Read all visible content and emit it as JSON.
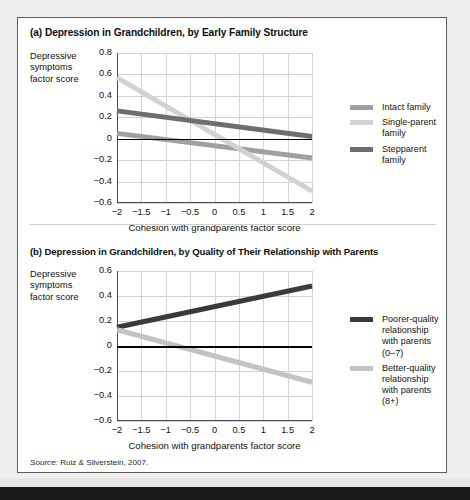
{
  "figure": {
    "source_prefix": "Source:",
    "source_text": "Ruiz & Silverstein, 2007."
  },
  "panel_a": {
    "title": "(a) Depression in Grandchildren, by Early Family Structure",
    "ycaption_line1": "Depressive",
    "ycaption_line2": "symptoms",
    "ycaption_line3": "factor score",
    "legend": [
      {
        "label": "Intact family",
        "color": "#a0a0a0"
      },
      {
        "label": "Single-parent family",
        "color": "#d2d2d2"
      },
      {
        "label": "Stepparent family",
        "color": "#6e6e6e"
      }
    ]
  },
  "panel_b": {
    "title": "(b) Depression in Grandchildren, by Quality of Their Relationship with Parents",
    "ycaption_line1": "Depressive",
    "ycaption_line2": "symptoms",
    "ycaption_line3": "factor score",
    "legend": [
      {
        "label": "Poorer-quality relationship with parents (0–7)",
        "color": "#3a3a3a"
      },
      {
        "label": "Better-quality relationship with parents (8+)",
        "color": "#c3c3c3"
      }
    ]
  },
  "chart_data": [
    {
      "id": "a",
      "type": "line",
      "title": "(a) Depression in Grandchildren, by Early Family Structure",
      "xlabel": "Cohesion with grandparents factor score",
      "ylabel": "Depressive symptoms factor score",
      "xlim": [
        -2,
        2
      ],
      "ylim": [
        -0.6,
        0.8
      ],
      "xticks": [
        -2,
        -1.5,
        -1,
        -0.5,
        0,
        0.5,
        1,
        1.5,
        2
      ],
      "xticklabels": [
        "−2",
        "−1.5",
        "−1",
        "−0.5",
        "0",
        "0.5",
        "1",
        "1.5",
        "2"
      ],
      "yticks": [
        -0.6,
        -0.4,
        -0.2,
        0,
        0.2,
        0.4,
        0.6,
        0.8
      ],
      "yticklabels": [
        "−0.6",
        "−0.4",
        "−0.2",
        "0",
        "0.2",
        "0.4",
        "0.6",
        "0.8"
      ],
      "grid": true,
      "zero_reference_line": 0,
      "legend_position": "right",
      "series": [
        {
          "name": "Intact family",
          "color": "#a0a0a0",
          "x": [
            -2,
            2
          ],
          "values": [
            0.05,
            -0.18
          ]
        },
        {
          "name": "Single-parent family",
          "color": "#d2d2d2",
          "x": [
            -2,
            2
          ],
          "values": [
            0.57,
            -0.49
          ]
        },
        {
          "name": "Stepparent family",
          "color": "#6e6e6e",
          "x": [
            -2,
            2
          ],
          "values": [
            0.26,
            0.02
          ]
        }
      ]
    },
    {
      "id": "b",
      "type": "line",
      "title": "(b) Depression in Grandchildren, by Quality of Their Relationship with Parents",
      "xlabel": "Cohesion with grandparents factor score",
      "ylabel": "Depressive symptoms factor score",
      "xlim": [
        -2,
        2
      ],
      "ylim": [
        -0.6,
        0.6
      ],
      "xticks": [
        -2,
        -1.5,
        -1,
        -0.5,
        0,
        0.5,
        1,
        1.5,
        2
      ],
      "xticklabels": [
        "−2",
        "−1.5",
        "−1",
        "−0.5",
        "0",
        "0.5",
        "1",
        "1.5",
        "2"
      ],
      "yticks": [
        -0.6,
        -0.4,
        -0.2,
        0,
        0.2,
        0.4,
        0.6
      ],
      "yticklabels": [
        "−0.6",
        "−0.4",
        "−0.2",
        "0",
        "0.2",
        "0.4",
        "0.6"
      ],
      "grid": true,
      "zero_reference_line": 0,
      "legend_position": "right",
      "series": [
        {
          "name": "Poorer-quality relationship with parents (0–7)",
          "color": "#3a3a3a",
          "x": [
            -2,
            2
          ],
          "values": [
            0.15,
            0.48
          ]
        },
        {
          "name": "Better-quality relationship with parents (8+)",
          "color": "#c3c3c3",
          "x": [
            -2,
            2
          ],
          "values": [
            0.13,
            -0.29
          ]
        }
      ]
    }
  ]
}
